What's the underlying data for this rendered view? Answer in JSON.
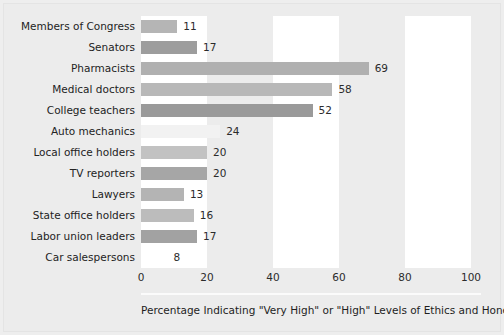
{
  "chart_data": {
    "type": "bar",
    "orientation": "horizontal",
    "title": "",
    "xlabel": "Percentage Indicating \"Very High\" or \"High\" Levels of Ethics and Honesty",
    "ylabel": "",
    "xlim": [
      0,
      100
    ],
    "xticks": [
      0,
      20,
      40,
      60,
      80,
      100
    ],
    "grid": false,
    "background_bands": [
      {
        "from": 0,
        "to": 20,
        "color": "#ffffff"
      },
      {
        "from": 20,
        "to": 40,
        "color": "#ececec"
      },
      {
        "from": 40,
        "to": 60,
        "color": "#ffffff"
      },
      {
        "from": 60,
        "to": 80,
        "color": "#ececec"
      },
      {
        "from": 80,
        "to": 100,
        "color": "#ffffff"
      }
    ],
    "legend": null,
    "categories": [
      "Members of Congress",
      "Senators",
      "Pharmacists",
      "Medical doctors",
      "College teachers",
      "Auto mechanics",
      "Local office holders",
      "TV reporters",
      "Lawyers",
      "State office holders",
      "Labor union leaders",
      "Car salespersons"
    ],
    "values": [
      11,
      17,
      69,
      58,
      52,
      24,
      20,
      20,
      13,
      16,
      17,
      8
    ],
    "bar_colors": [
      "#b5b5b5",
      "#9d9d9d",
      "#b0b0b0",
      "#b8b8b8",
      "#9a9a9a",
      "#f2f2f2",
      "#c2c2c2",
      "#a6a6a6",
      "#b4b4b4",
      "#bcbcbc",
      "#a2a2a2",
      "#ffffff"
    ],
    "data_labels": [
      "11",
      "17",
      "69",
      "58",
      "52",
      "24",
      "20",
      "20",
      "13",
      "16",
      "17",
      "8"
    ]
  },
  "figure": {
    "background_color": "#ececec",
    "text_color": "#232323"
  }
}
